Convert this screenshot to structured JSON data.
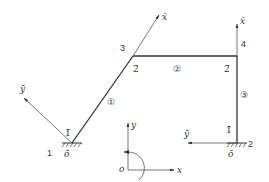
{
  "diagram": {
    "title": "",
    "colors": {
      "line": "#333333",
      "thin": "#555555",
      "text": "#333333",
      "bg": "#ffffff"
    },
    "nodes": [
      {
        "id": "1",
        "label": "1",
        "x": 72,
        "y": 143
      },
      {
        "id": "2",
        "label": "2",
        "x": 237,
        "y": 143
      },
      {
        "id": "3",
        "label": "3",
        "x": 133,
        "y": 56
      },
      {
        "id": "4",
        "label": "4",
        "x": 237,
        "y": 56
      }
    ],
    "members": [
      {
        "id": "1",
        "label": "①",
        "from": "1",
        "to": "3",
        "start_local": "1̄",
        "end_local": "2̄"
      },
      {
        "id": "2",
        "label": "②",
        "from": "3",
        "to": "4",
        "end_local": "2̄"
      },
      {
        "id": "3",
        "label": "③",
        "from": "2",
        "to": "4",
        "start_local": "1̄"
      }
    ],
    "labels": {
      "node1": "1",
      "node2": "2",
      "node3": "3",
      "node4": "4",
      "member1": "①",
      "member2": "②",
      "member3": "③",
      "m1_start": "1̄",
      "m1_end": "2̄",
      "m2_end": "2̄",
      "m3_start": "1̄",
      "local_x_m1": "x̄",
      "local_y_m1": "ȳ",
      "local_o_m1": "ō",
      "local_x_m3": "x̄",
      "local_y_m3": "ȳ",
      "local_o_m3": "ō",
      "global_x": "x",
      "global_y": "y",
      "global_o": "o"
    },
    "supports": [
      {
        "node": "1",
        "type": "fixed"
      },
      {
        "node": "2",
        "type": "fixed"
      }
    ],
    "global_axes": {
      "origin": [
        128,
        170
      ],
      "x_end": [
        174,
        170
      ],
      "y_end": [
        128,
        123
      ],
      "rotation": "clockwise-positive"
    }
  }
}
